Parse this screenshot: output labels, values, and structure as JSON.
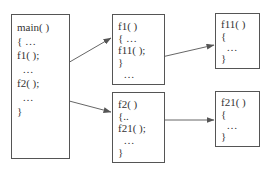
{
  "diagram": {
    "type": "function-call-hierarchy",
    "nodes": [
      {
        "id": "main",
        "lines": [
          "main( )",
          "{ …",
          "f1( );",
          "  …",
          "f2( );",
          "  …",
          "}"
        ]
      },
      {
        "id": "f1",
        "lines": [
          "f1( )",
          "{ …",
          "f11( );",
          "}",
          "  …"
        ]
      },
      {
        "id": "f2",
        "lines": [
          "f2( )",
          "{..",
          "f21( );",
          "  …",
          "}"
        ]
      },
      {
        "id": "f11",
        "lines": [
          "f11( )",
          "{",
          "  …",
          "}"
        ]
      },
      {
        "id": "f21",
        "lines": [
          "f21( )",
          "{",
          "  …",
          "}"
        ]
      }
    ],
    "edges": [
      {
        "from": "main",
        "to": "f1",
        "label": "f1( ) call"
      },
      {
        "from": "main",
        "to": "f2",
        "label": "f2( ) call"
      },
      {
        "from": "f1",
        "to": "f11",
        "label": "f11( ) call"
      },
      {
        "from": "f2",
        "to": "f21",
        "label": "f21( ) call"
      }
    ]
  }
}
